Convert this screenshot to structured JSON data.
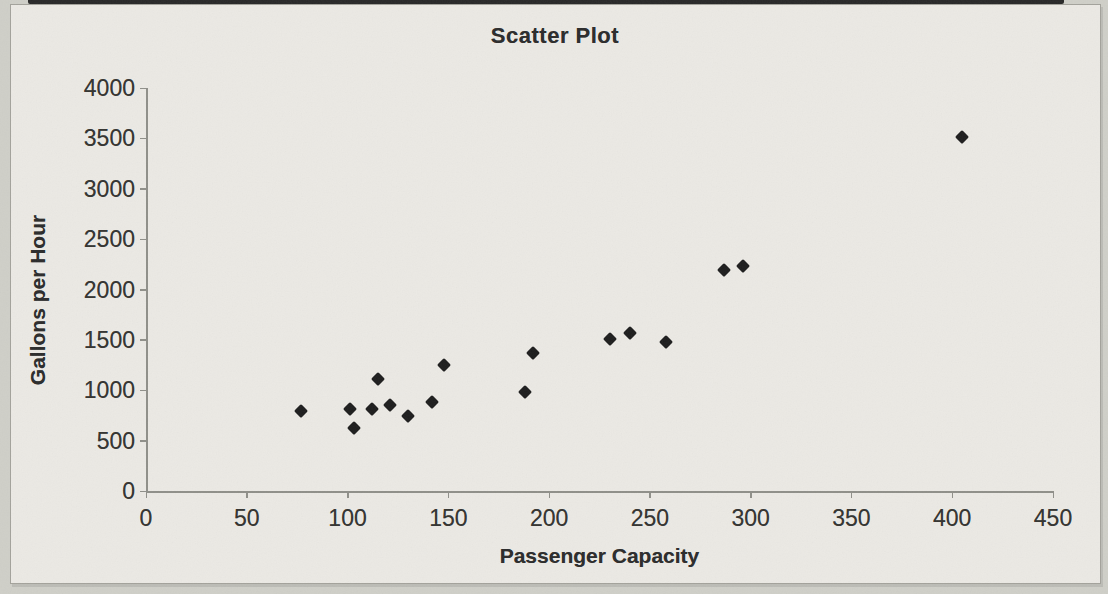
{
  "page": {
    "kind": "scanned excel chart",
    "background_color": "#cfcfc8",
    "paper_color": "#ebe9e4",
    "border_color": "#a3a29b",
    "scan_strip_color": "#1a1a1a"
  },
  "chart_data": {
    "type": "scatter",
    "title": "Scatter Plot",
    "xlabel": "Passenger Capacity",
    "ylabel": "Gallons per Hour",
    "xlim": [
      0,
      450
    ],
    "ylim": [
      0,
      4000
    ],
    "xticks": [
      0,
      50,
      100,
      150,
      200,
      250,
      300,
      350,
      400,
      450
    ],
    "yticks": [
      0,
      500,
      1000,
      1500,
      2000,
      2500,
      3000,
      3500,
      4000
    ],
    "grid": false,
    "legend": "none",
    "marker": {
      "shape": "diamond",
      "color": "#1d1d1d",
      "size_px": 14
    },
    "axis_color": "#8f8f89",
    "points": [
      [
        77,
        790
      ],
      [
        101,
        815
      ],
      [
        103,
        630
      ],
      [
        112,
        815
      ],
      [
        115,
        1110
      ],
      [
        121,
        850
      ],
      [
        130,
        740
      ],
      [
        142,
        885
      ],
      [
        148,
        1250
      ],
      [
        188,
        985
      ],
      [
        192,
        1365
      ],
      [
        230,
        1510
      ],
      [
        240,
        1565
      ],
      [
        258,
        1480
      ],
      [
        287,
        2195
      ],
      [
        296,
        2235
      ],
      [
        405,
        3515
      ]
    ]
  }
}
